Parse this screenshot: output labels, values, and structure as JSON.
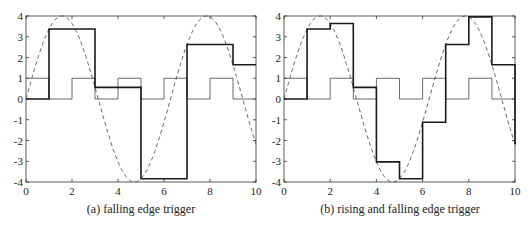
{
  "chart_data": [
    {
      "type": "line",
      "title": "",
      "caption": "(a) falling edge trigger",
      "xlabel": "",
      "ylabel": "",
      "xlim": [
        0,
        10
      ],
      "ylim": [
        -4,
        4
      ],
      "xticks": [
        0,
        2,
        4,
        6,
        8,
        10
      ],
      "yticks": [
        -4,
        -3,
        -2,
        -1,
        0,
        1,
        2,
        3,
        4
      ],
      "grid": false,
      "series": [
        {
          "name": "input signal (dashed)",
          "style": "dashed",
          "function": "4*sin(x)",
          "x": [
            0,
            0.5,
            1,
            1.5,
            2,
            2.5,
            3,
            3.5,
            4,
            4.5,
            5,
            5.5,
            6,
            6.5,
            7,
            7.5,
            8,
            8.5,
            9,
            9.5,
            10
          ],
          "y": [
            0,
            1.92,
            3.37,
            3.99,
            3.64,
            2.39,
            0.56,
            -1.4,
            -3.03,
            -3.91,
            -3.84,
            -2.83,
            -1.12,
            0.86,
            2.63,
            3.75,
            3.96,
            3.18,
            1.65,
            -0.3,
            -2.18
          ]
        },
        {
          "name": "clock (thin)",
          "style": "step-thin",
          "x": [
            0,
            1,
            2,
            3,
            4,
            5,
            6,
            7,
            8,
            9,
            10
          ],
          "y": [
            1,
            0,
            1,
            0,
            1,
            0,
            1,
            0,
            1,
            0,
            0
          ]
        },
        {
          "name": "sample-and-hold output (thick)",
          "style": "step-thick",
          "x": [
            0,
            1,
            3,
            5,
            7,
            9,
            10
          ],
          "y": [
            0,
            3.37,
            0.56,
            -3.84,
            2.63,
            1.65,
            1.65
          ]
        }
      ]
    },
    {
      "type": "line",
      "title": "",
      "caption": "(b) rising and falling edge trigger",
      "xlabel": "",
      "ylabel": "",
      "xlim": [
        0,
        10
      ],
      "ylim": [
        -4,
        4
      ],
      "xticks": [
        0,
        2,
        4,
        6,
        8,
        10
      ],
      "yticks": [
        -4,
        -3,
        -2,
        -1,
        0,
        1,
        2,
        3,
        4
      ],
      "grid": false,
      "series": [
        {
          "name": "input signal (dashed)",
          "style": "dashed",
          "function": "4*sin(x)",
          "x": [
            0,
            0.5,
            1,
            1.5,
            2,
            2.5,
            3,
            3.5,
            4,
            4.5,
            5,
            5.5,
            6,
            6.5,
            7,
            7.5,
            8,
            8.5,
            9,
            9.5,
            10
          ],
          "y": [
            0,
            1.92,
            3.37,
            3.99,
            3.64,
            2.39,
            0.56,
            -1.4,
            -3.03,
            -3.91,
            -3.84,
            -2.83,
            -1.12,
            0.86,
            2.63,
            3.75,
            3.96,
            3.18,
            1.65,
            -0.3,
            -2.18
          ]
        },
        {
          "name": "clock (thin)",
          "style": "step-thin",
          "x": [
            0,
            1,
            2,
            3,
            4,
            5,
            6,
            7,
            8,
            9,
            10
          ],
          "y": [
            1,
            0,
            1,
            0,
            1,
            0,
            1,
            0,
            1,
            0,
            0
          ]
        },
        {
          "name": "sample-and-hold output (thick)",
          "style": "step-thick",
          "x": [
            0,
            1,
            2,
            3,
            4,
            5,
            6,
            7,
            8,
            9,
            10
          ],
          "y": [
            0,
            3.37,
            3.64,
            0.56,
            -3.03,
            -3.84,
            -1.12,
            2.63,
            3.96,
            1.65,
            -2.18
          ]
        }
      ]
    }
  ],
  "panels": [
    {
      "caption": "(a) falling edge trigger",
      "left": 26,
      "right": 256,
      "top": 16,
      "bottom": 182
    },
    {
      "caption": "(b) rising and falling edge trigger",
      "left": 284,
      "right": 515,
      "top": 16,
      "bottom": 182
    }
  ],
  "colors": {
    "axis": "#333333",
    "dashed": "#555555",
    "thin": "#444444",
    "thick": "#1a1a1a"
  }
}
